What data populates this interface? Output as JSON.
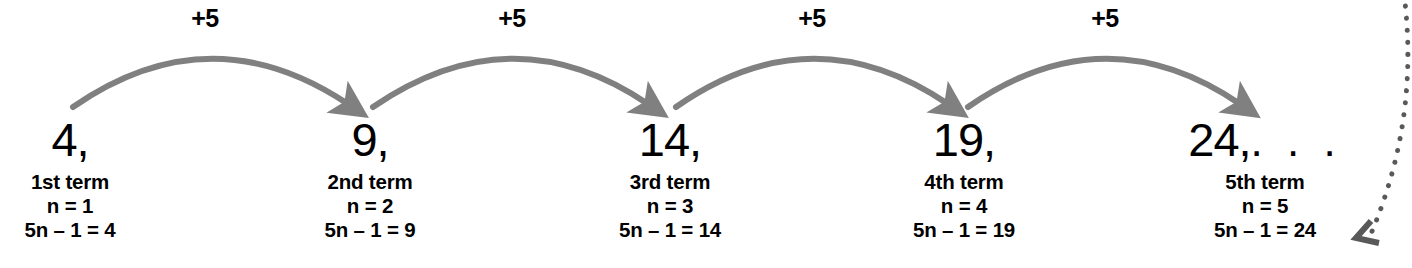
{
  "diagram": {
    "colors": {
      "arrow": "#808080",
      "dotted_arrow": "#595959",
      "text": "#000000",
      "background": "#ffffff"
    },
    "steps": [
      {
        "label": "+5",
        "x": 205
      },
      {
        "label": "+5",
        "x": 512
      },
      {
        "label": "+5",
        "x": 812
      },
      {
        "label": "+5",
        "x": 1105
      }
    ],
    "terms": [
      {
        "value": "4,",
        "ellipsis": "",
        "name": "1st term",
        "n": "n = 1",
        "formula": "5n – 1 = 4",
        "x": 70
      },
      {
        "value": "9,",
        "ellipsis": "",
        "name": "2nd term",
        "n": "n = 2",
        "formula": "5n – 1 = 9",
        "x": 370
      },
      {
        "value": "14,",
        "ellipsis": "",
        "name": "3rd term",
        "n": "n = 3",
        "formula": "5n – 1 = 14",
        "x": 670
      },
      {
        "value": "19,",
        "ellipsis": "",
        "name": "4th term",
        "n": "n = 4",
        "formula": "5n – 1 = 19",
        "x": 964
      },
      {
        "value": "24,",
        "ellipsis": ". . .",
        "name": "5th term",
        "n": "n = 5",
        "formula": "5n – 1 = 24",
        "x": 1265
      }
    ]
  }
}
